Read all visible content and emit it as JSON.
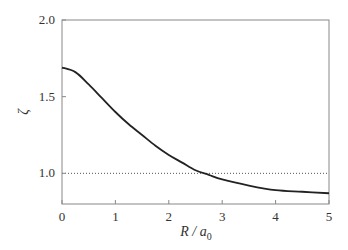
{
  "chart_data": {
    "type": "line",
    "title": "",
    "xlabel": "R / a0",
    "xlabel_main": "R / a",
    "xlabel_sub": "0",
    "ylabel": "ζ",
    "xlim": [
      0,
      5
    ],
    "ylim": [
      0.8,
      2.0
    ],
    "xticks": [
      "0",
      "1",
      "2",
      "3",
      "4",
      "5"
    ],
    "yticks": [
      "1.0",
      "1.5",
      "2.0"
    ],
    "grid": false,
    "legend": null,
    "series": [
      {
        "name": "zeta",
        "style": "solid",
        "color": "#222222",
        "x": [
          0,
          0.25,
          0.5,
          0.75,
          1.0,
          1.25,
          1.5,
          1.75,
          2.0,
          2.25,
          2.5,
          2.75,
          3.0,
          3.5,
          4.0,
          4.5,
          5.0
        ],
        "y": [
          1.69,
          1.66,
          1.58,
          1.49,
          1.4,
          1.32,
          1.25,
          1.18,
          1.12,
          1.07,
          1.02,
          0.99,
          0.96,
          0.92,
          0.89,
          0.88,
          0.87
        ]
      },
      {
        "name": "reference",
        "style": "dotted",
        "color": "#555555",
        "x": [
          0,
          5
        ],
        "y": [
          1.0,
          1.0
        ]
      }
    ]
  }
}
